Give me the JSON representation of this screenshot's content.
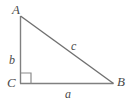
{
  "figure": {
    "type": "right-triangle-diagram",
    "background_color": "#ffffff",
    "stroke_color": "#808080",
    "label_color": "#4a4a4a"
  },
  "vertices": [
    {
      "id": "A",
      "label": "A",
      "x": 20,
      "y": 16
    },
    {
      "id": "B",
      "label": "B",
      "x": 113,
      "y": 83
    },
    {
      "id": "C",
      "label": "C",
      "x": 20,
      "y": 83
    }
  ],
  "sides": [
    {
      "id": "a",
      "label": "a",
      "from": "C",
      "to": "B",
      "position": "bottom"
    },
    {
      "id": "b",
      "label": "b",
      "from": "A",
      "to": "C",
      "position": "left"
    },
    {
      "id": "c",
      "label": "c",
      "from": "A",
      "to": "B",
      "position": "hypotenuse"
    }
  ],
  "markers": [
    {
      "id": "right-angle-C",
      "type": "right-angle-square",
      "at_vertex": "C",
      "size": 10
    }
  ]
}
